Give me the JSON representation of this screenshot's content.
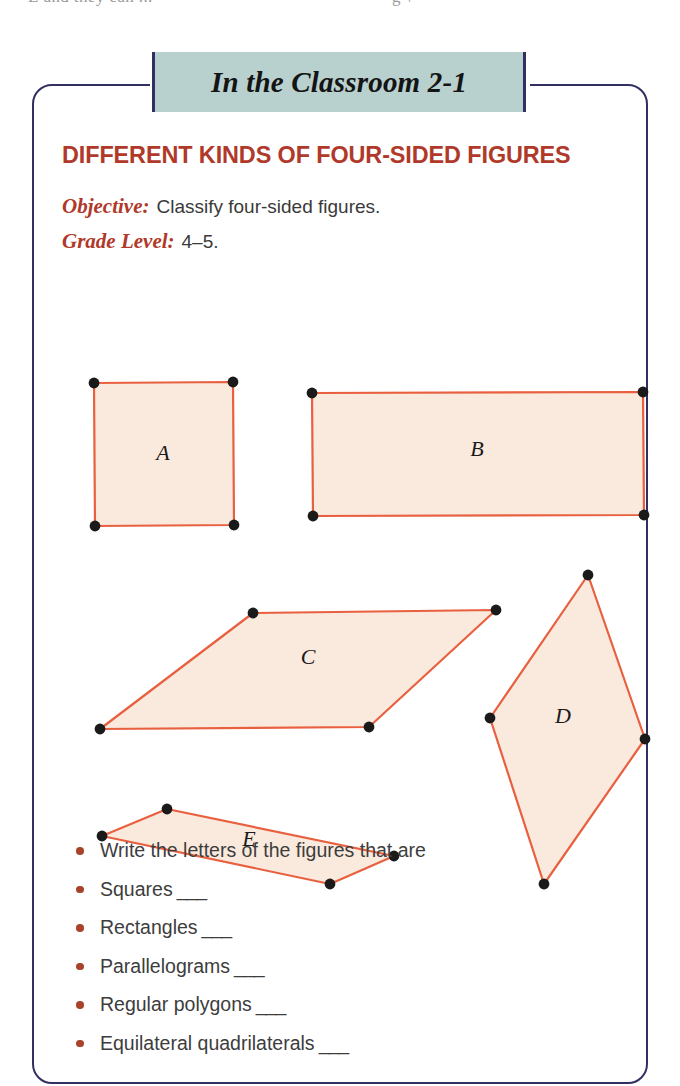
{
  "page": {
    "clipped_top_line_fragment_left": "E and they can ...",
    "clipped_top_line_fragment_right": "g \\"
  },
  "banner": {
    "title": "In the Classroom 2-1",
    "fill_color": "#b8d0ce",
    "edge_color": "#322f63"
  },
  "box": {
    "border_color": "#322f63"
  },
  "activity": {
    "heading": "DIFFERENT KINDS OF FOUR-SIDED FIGURES",
    "heading_color": "#b0392a",
    "objective_label": "Objective:",
    "objective_value": "Classify four-sided figures.",
    "grade_label": "Grade Level:",
    "grade_value": "4–5."
  },
  "figures": {
    "stroke_color": "#e8603f",
    "fill_color": "#faeade",
    "vertex_color": "#1a1a1a",
    "label_color": "#1a1a1a",
    "items": [
      {
        "label": "A",
        "shape": "square",
        "points": "60,297 199,296 200,439 61,440",
        "label_x": 129,
        "label_y": 374
      },
      {
        "label": "B",
        "shape": "rectangle",
        "points": "278,307 609,306 610,429 279,430",
        "label_x": 443,
        "label_y": 370
      },
      {
        "label": "C",
        "shape": "parallelogram",
        "points": "219,527 462,524 335,641 66,643",
        "label_x": 274,
        "label_y": 578
      },
      {
        "label": "D",
        "shape": "kite",
        "points": "554,489 611,653 510,798 456,632",
        "label_x": 529,
        "label_y": 637
      },
      {
        "label": "E",
        "shape": "thin-parallelogram",
        "points": "133,723 360,770 296,798 68,750",
        "label_x": 215,
        "label_y": 760
      }
    ]
  },
  "tasks": {
    "bullet_color": "#a8432a",
    "items": [
      {
        "text": "Write the letters of the figures that are",
        "blank": ""
      },
      {
        "text": "Squares",
        "blank": "___"
      },
      {
        "text": "Rectangles",
        "blank": "___"
      },
      {
        "text": "Parallelograms",
        "blank": "___"
      },
      {
        "text": "Regular polygons",
        "blank": "___"
      },
      {
        "text": "Equilateral quadrilaterals",
        "blank": "___"
      }
    ]
  }
}
